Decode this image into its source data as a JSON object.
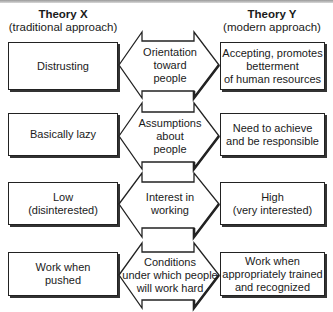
{
  "header": {
    "left": {
      "title": "Theory X",
      "subtitle": "(traditional approach)"
    },
    "right": {
      "title": "Theory Y",
      "subtitle": "(modern approach)"
    }
  },
  "rows": [
    {
      "left": "Distrusting",
      "center": "Orientation\ntoward\npeople",
      "right": "Accepting, promotes\nbetterment\nof human resources"
    },
    {
      "left": "Basically lazy",
      "center": "Assumptions\nabout\npeople",
      "right": "Need to achieve\nand be responsible"
    },
    {
      "left": "Low\n(disinterested)",
      "center": "Interest in\nworking",
      "right": "High\n(very interested)"
    },
    {
      "left": "Work when\npushed",
      "center": "Conditions\nunder which people\nwill work hard",
      "right": "Work when\nappropriately trained\nand recognized"
    }
  ],
  "colors": {
    "stroke": "#222222",
    "shadow": "#333333",
    "band": "#9a9a9a"
  }
}
